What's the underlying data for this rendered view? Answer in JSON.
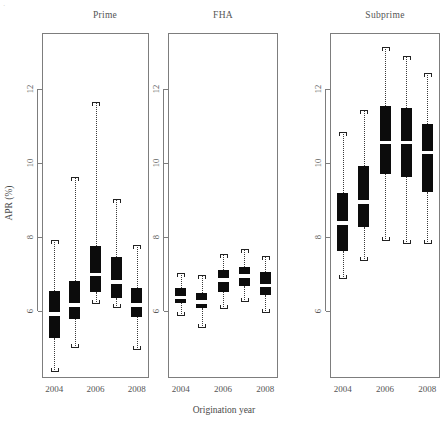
{
  "figure": {
    "ylabel": "APR (%)",
    "xlabel": "Origination year",
    "corner_mark": "·"
  },
  "chart_data": {
    "type": "box",
    "title": "",
    "xlabel": "Origination year",
    "ylabel": "APR (%)",
    "ylim": [
      4.2,
      13.5
    ],
    "yticks": [
      6,
      8,
      10,
      12
    ],
    "ytick_labels": [
      "6",
      "8",
      "10",
      "12"
    ],
    "x": [
      2004,
      2005,
      2006,
      2007,
      2008
    ],
    "xticks": [
      2004,
      2006,
      2008
    ],
    "xtick_labels": [
      "2004",
      "2006",
      "2008"
    ],
    "grid": false,
    "legend": "none",
    "panels": [
      {
        "name": "Prime",
        "label": "Prime",
        "boxes": [
          {
            "year": 2004,
            "lower_whisker": 4.35,
            "q1": 5.28,
            "median": 5.93,
            "q3": 6.55,
            "upper_whisker": 7.93
          },
          {
            "year": 2005,
            "lower_whisker": 5.0,
            "q1": 5.8,
            "median": 6.18,
            "q3": 6.82,
            "upper_whisker": 9.62
          },
          {
            "year": 2006,
            "lower_whisker": 6.2,
            "q1": 6.52,
            "median": 7.0,
            "q3": 7.75,
            "upper_whisker": 11.65
          },
          {
            "year": 2007,
            "lower_whisker": 6.08,
            "q1": 6.35,
            "median": 6.8,
            "q3": 7.45,
            "upper_whisker": 9.02
          },
          {
            "year": 2008,
            "lower_whisker": 4.95,
            "q1": 5.85,
            "median": 6.18,
            "q3": 6.62,
            "upper_whisker": 7.78
          }
        ]
      },
      {
        "name": "FHA",
        "label": "FHA",
        "boxes": [
          {
            "year": 2004,
            "lower_whisker": 5.88,
            "q1": 6.22,
            "median": 6.38,
            "q3": 6.62,
            "upper_whisker": 7.02
          },
          {
            "year": 2005,
            "lower_whisker": 5.55,
            "q1": 6.08,
            "median": 6.25,
            "q3": 6.5,
            "upper_whisker": 6.98
          },
          {
            "year": 2006,
            "lower_whisker": 6.05,
            "q1": 6.52,
            "median": 6.85,
            "q3": 7.1,
            "upper_whisker": 7.55
          },
          {
            "year": 2007,
            "lower_whisker": 6.25,
            "q1": 6.68,
            "median": 6.95,
            "q3": 7.2,
            "upper_whisker": 7.68
          },
          {
            "year": 2008,
            "lower_whisker": 5.95,
            "q1": 6.45,
            "median": 6.7,
            "q3": 7.05,
            "upper_whisker": 7.5
          }
        ]
      },
      {
        "name": "Subprime",
        "label": "Subprime",
        "boxes": [
          {
            "year": 2004,
            "lower_whisker": 6.88,
            "q1": 7.62,
            "median": 8.38,
            "q3": 9.18,
            "upper_whisker": 10.82
          },
          {
            "year": 2005,
            "lower_whisker": 7.35,
            "q1": 8.28,
            "median": 8.95,
            "q3": 9.92,
            "upper_whisker": 11.42
          },
          {
            "year": 2006,
            "lower_whisker": 7.9,
            "q1": 9.7,
            "median": 10.55,
            "q3": 11.52,
            "upper_whisker": 13.12
          },
          {
            "year": 2007,
            "lower_whisker": 7.82,
            "q1": 9.62,
            "median": 10.55,
            "q3": 11.48,
            "upper_whisker": 12.88
          },
          {
            "year": 2008,
            "lower_whisker": 7.82,
            "q1": 9.22,
            "median": 10.28,
            "q3": 11.05,
            "upper_whisker": 12.42
          }
        ]
      }
    ]
  },
  "layout": {
    "panels": [
      {
        "key": "Prime",
        "left": 42,
        "width": 107,
        "title_cx": 105
      },
      {
        "key": "FHA",
        "left": 168,
        "width": 110,
        "title_cx": 223
      },
      {
        "key": "Subprime",
        "left": 330,
        "width": 110,
        "title_cx": 385
      }
    ],
    "plot_top": 33,
    "plot_bottom": 378,
    "y_value_at_top": 13.5,
    "y_value_at_bottom": 4.2,
    "box_width": 11,
    "colors": {
      "box_fill": "#0c0c0c",
      "median": "#ffffff",
      "frame": "#7d7d7d",
      "text": "#4a4a4a",
      "whisker": "#3a3a3a"
    }
  }
}
